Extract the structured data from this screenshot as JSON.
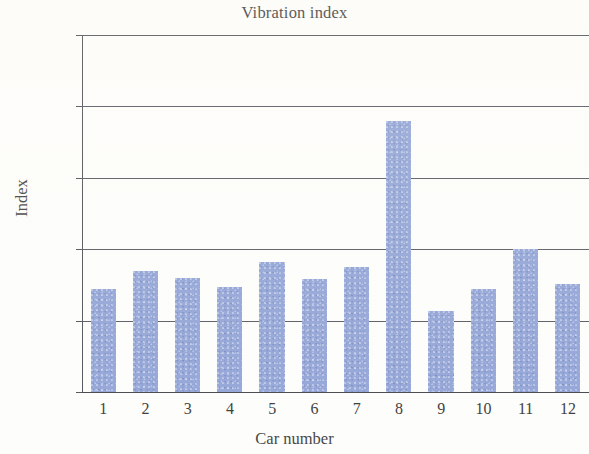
{
  "chart_data": {
    "type": "bar",
    "title": "Vibration index",
    "xlabel": "Car number",
    "ylabel": "Index",
    "categories": [
      "1",
      "2",
      "3",
      "4",
      "5",
      "6",
      "7",
      "8",
      "9",
      "10",
      "11",
      "12"
    ],
    "values": [
      0.72,
      0.85,
      0.8,
      0.735,
      0.91,
      0.79,
      0.875,
      1.9,
      0.57,
      0.72,
      1.0,
      0.76
    ],
    "series": [
      {
        "name": "Vibration index",
        "values": [
          0.72,
          0.85,
          0.8,
          0.735,
          0.91,
          0.79,
          0.875,
          1.9,
          0.57,
          0.72,
          1.0,
          0.76
        ]
      }
    ],
    "ylim": [
      0,
      2.5
    ],
    "ytick_labels": [
      "2.5",
      "2",
      "1.5",
      "1",
      "0.5",
      "0"
    ],
    "ytick_values": [
      2.5,
      2.0,
      1.5,
      1.0,
      0.5,
      0
    ],
    "grid": true,
    "grid_axis": "y",
    "legend": false,
    "bar_color": "#8fa2d6",
    "axis_color": "#4a4c52",
    "background_color": "#fdfdfb"
  },
  "axis": {
    "y_title": "Index",
    "x_title": "Car number"
  },
  "title_text": "Vibration index"
}
